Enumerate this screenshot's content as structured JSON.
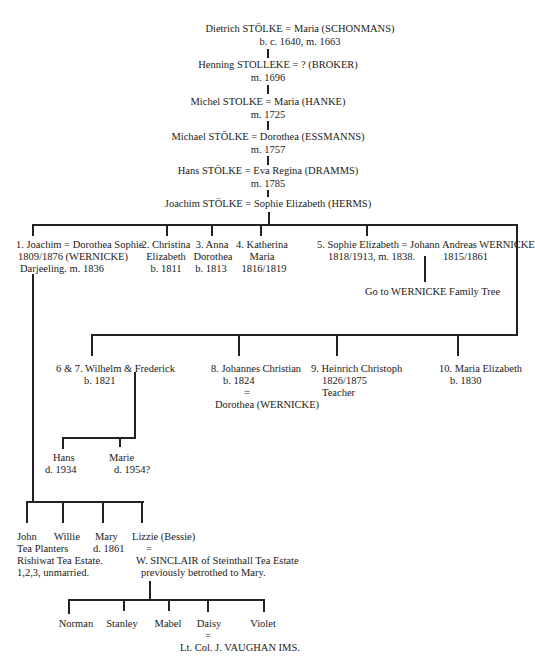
{
  "ancestors": [
    {
      "line1": "Dietrich STÖLKE = Maria (SCHONMANS)",
      "line2": "b. c. 1640, m. 1663"
    },
    {
      "line1": "Henning STOLLEKE = ? (BROKER)",
      "line2": "m. 1696"
    },
    {
      "line1": "Michel STOLKE = Maria (HANKE)",
      "line2": "m. 1725"
    },
    {
      "line1": "Michael STÖLKE = Dorothea (ESSMANNS)",
      "line2": "m. 1757"
    },
    {
      "line1": "Hans STÖLKE = Eva Regina (DRAMMS)",
      "line2": "m. 1785"
    },
    {
      "line1": "Joachim STÖLKE  = Sophie Elizabeth (HERMS)",
      "line2": ""
    }
  ],
  "children_row1": [
    {
      "l1": "1. Joachim = Dorothea Sophie",
      "l2": "1809/1876     (WERNICKE)",
      "l3": "Darjeeling. m. 1836"
    },
    {
      "l1": "2. Christina",
      "l2": "Elizabeth",
      "l3": "b. 1811"
    },
    {
      "l1": "3. Anna",
      "l2": "Dorothea",
      "l3": "b. 1813"
    },
    {
      "l1": "4. Katherina",
      "l2": "Maria",
      "l3": "1816/1819"
    },
    {
      "l1": "5. Sophie Elizabeth = Johann Andreas WERNICKE",
      "l2": "1818/1913, m. 1838.",
      "l2b": "1815/1861"
    }
  ],
  "wernicke_link": "Go to WERNICKE Family Tree",
  "children_row2": [
    {
      "l1": "6 & 7. Wilhelm & Frederick",
      "l2": "b. 1821"
    },
    {
      "l1": "8. Johannes Christian",
      "l2": "b. 1824",
      "l3": "=",
      "l4": "Dorothea (WERNICKE)"
    },
    {
      "l1": "9. Heinrich Christoph",
      "l2": "1826/1875",
      "l3": "Teacher"
    },
    {
      "l1": "10. Maria Elizabeth",
      "l2": "b. 1830"
    }
  ],
  "wilhelm_children": [
    {
      "l1": "Hans",
      "l2": "d. 1934"
    },
    {
      "l1": "Marie",
      "l2": "d. 1954?"
    }
  ],
  "joachim_children": {
    "names": [
      "John",
      "Willie",
      "Mary",
      "Lizzie (Bessie)"
    ],
    "john_willie_note": [
      "Tea Planters",
      "Rishiwat Tea Estate.",
      "1,2,3, unmarried."
    ],
    "mary_note": "d. 1861",
    "lizzie_eq": "=",
    "lizzie_spouse": "W. SINCLAIR of Steinthall Tea Estate",
    "lizzie_spouse_note": "previously betrothed to Mary."
  },
  "lizzie_children": {
    "names": [
      "Norman",
      "Stanley",
      "Mabel",
      "Daisy",
      "Violet"
    ],
    "daisy_eq": "=",
    "daisy_spouse": "Lt. Col. J. VAUGHAN IMS."
  }
}
